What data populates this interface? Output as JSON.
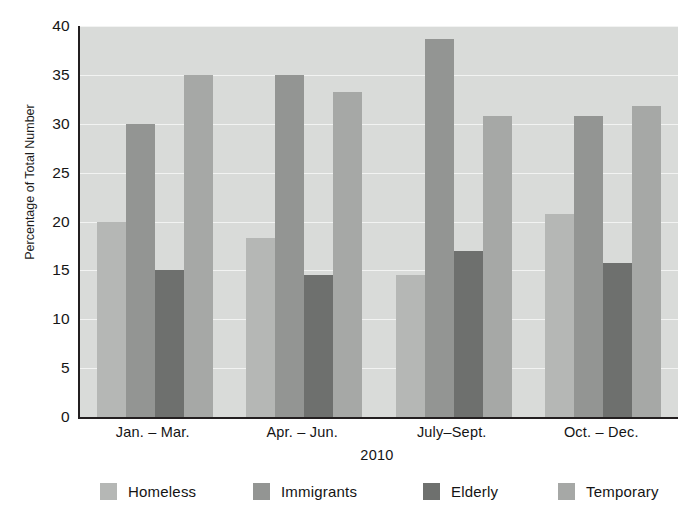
{
  "figure": {
    "title_partial": "",
    "background": "#ffffff",
    "plot_background": "#d9dbd9",
    "axis_color": "#231f20",
    "gridline_color": "#f2f3f2"
  },
  "axes": {
    "ylabel": "Percentage of Total Number",
    "xlabel": "2010",
    "yticks": [
      "0",
      "5",
      "10",
      "15",
      "20",
      "25",
      "30",
      "35",
      "40"
    ],
    "ytick_values": [
      0,
      5,
      10,
      15,
      20,
      25,
      30,
      35,
      40
    ],
    "ymin": 0,
    "ymax": 40
  },
  "legend": {
    "position": "bottom",
    "items": [
      {
        "label": "Homeless",
        "color": "#b5b7b5"
      },
      {
        "label": "Immigrants",
        "color": "#939593"
      },
      {
        "label": "Elderly",
        "color": "#6e706e"
      },
      {
        "label": "Temporary",
        "color": "#a6a8a6"
      }
    ]
  },
  "chart_data": {
    "type": "bar",
    "title": "",
    "xlabel": "2010",
    "ylabel": "Percentage of Total Number",
    "categories": [
      "Jan. – Mar.",
      "Apr. – Jun.",
      "July–Sept.",
      "Oct. – Dec."
    ],
    "series": [
      {
        "name": "Homeless",
        "color": "#b5b7b5",
        "values": [
          20.0,
          18.3,
          14.5,
          20.8
        ]
      },
      {
        "name": "Immigrants",
        "color": "#939593",
        "values": [
          30.0,
          35.0,
          38.7,
          30.8
        ]
      },
      {
        "name": "Elderly",
        "color": "#6e706e",
        "values": [
          15.0,
          14.5,
          17.0,
          15.8
        ]
      },
      {
        "name": "Temporary",
        "color": "#a6a8a6",
        "values": [
          35.0,
          33.3,
          30.8,
          31.8
        ]
      }
    ],
    "ylim": [
      0,
      40
    ],
    "ytick_step": 5,
    "grid": true,
    "legend_position": "bottom",
    "grouped": true
  }
}
